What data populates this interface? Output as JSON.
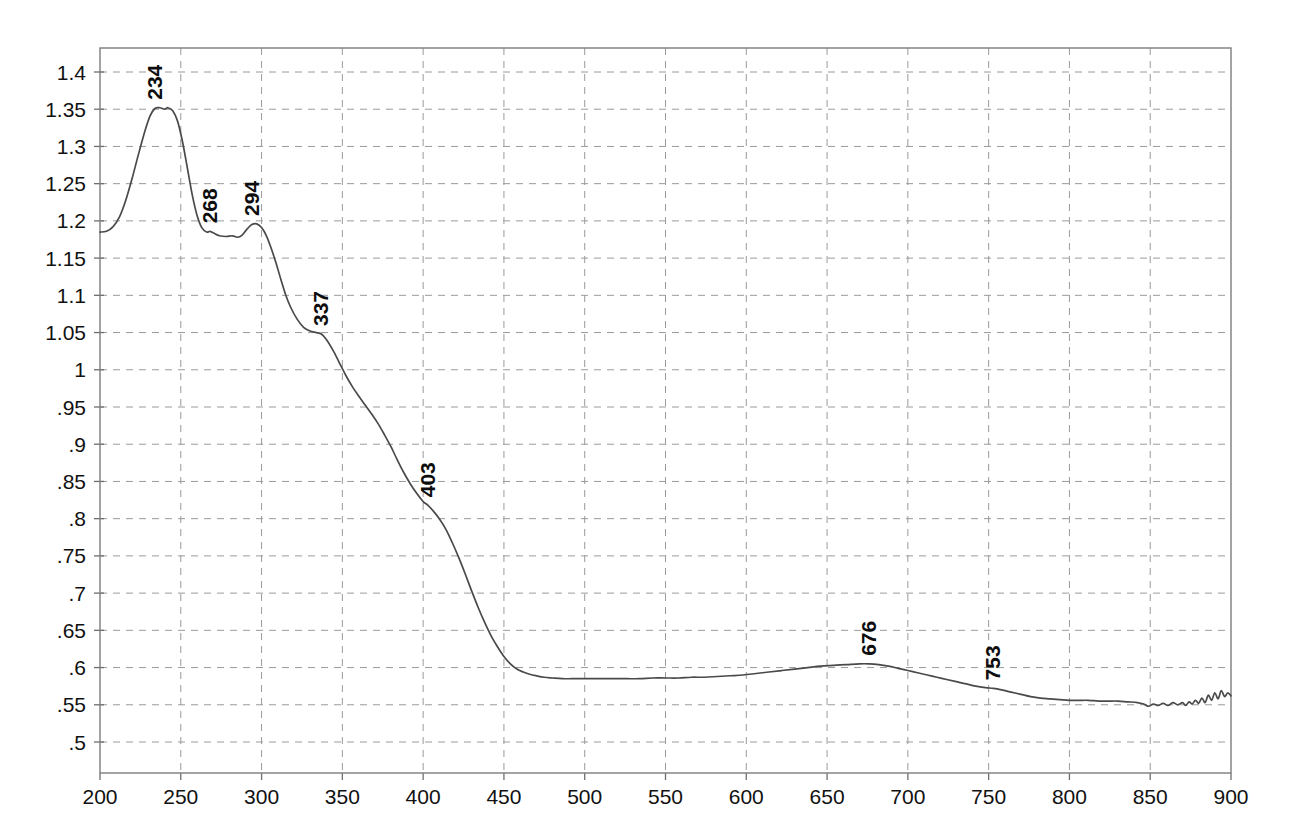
{
  "chart_data": {
    "type": "line",
    "title": "",
    "subtitle": "",
    "xlabel": "",
    "ylabel": "",
    "xlim": [
      200,
      900
    ],
    "ylim": [
      0.475,
      1.425
    ],
    "grid": true,
    "legend": null,
    "x_ticks": [
      200,
      250,
      300,
      350,
      400,
      450,
      500,
      550,
      600,
      650,
      700,
      750,
      800,
      850,
      900
    ],
    "x_tick_labels": [
      "200",
      "250",
      "300",
      "350",
      "400",
      "450",
      "500",
      "550",
      "600",
      "650",
      "700",
      "750",
      "800",
      "850",
      "900"
    ],
    "y_ticks": [
      0.5,
      0.55,
      0.6,
      0.65,
      0.7,
      0.75,
      0.8,
      0.85,
      0.9,
      0.95,
      1.0,
      1.05,
      1.1,
      1.15,
      1.2,
      1.25,
      1.3,
      1.35,
      1.4
    ],
    "y_tick_labels": [
      ".5",
      ".55",
      ".6",
      ".65",
      ".7",
      ".75",
      ".8",
      ".85",
      ".9",
      ".95",
      "1",
      "1.05",
      "1.1",
      "1.15",
      "1.2",
      "1.25",
      "1.3",
      "1.35",
      "1.4"
    ],
    "annotations": [
      {
        "label": "234",
        "x": 234,
        "y": 1.352
      },
      {
        "label": "268",
        "x": 268,
        "y": 1.186
      },
      {
        "label": "294",
        "x": 294,
        "y": 1.196
      },
      {
        "label": "337",
        "x": 337,
        "y": 1.048
      },
      {
        "label": "403",
        "x": 403,
        "y": 0.818
      },
      {
        "label": "676",
        "x": 676,
        "y": 0.605
      },
      {
        "label": "753",
        "x": 753,
        "y": 0.572
      }
    ],
    "series": [
      {
        "name": "absorbance",
        "color": "#4a4a4a",
        "points": [
          [
            200,
            1.185
          ],
          [
            204,
            1.186
          ],
          [
            208,
            1.192
          ],
          [
            212,
            1.205
          ],
          [
            216,
            1.228
          ],
          [
            220,
            1.258
          ],
          [
            224,
            1.291
          ],
          [
            228,
            1.322
          ],
          [
            231,
            1.341
          ],
          [
            234,
            1.351
          ],
          [
            237,
            1.352
          ],
          [
            240,
            1.35
          ],
          [
            242,
            1.352
          ],
          [
            245,
            1.348
          ],
          [
            248,
            1.334
          ],
          [
            251,
            1.307
          ],
          [
            254,
            1.272
          ],
          [
            257,
            1.236
          ],
          [
            260,
            1.208
          ],
          [
            263,
            1.191
          ],
          [
            266,
            1.185
          ],
          [
            268,
            1.186
          ],
          [
            270,
            1.184
          ],
          [
            274,
            1.18
          ],
          [
            278,
            1.179
          ],
          [
            282,
            1.18
          ],
          [
            285,
            1.178
          ],
          [
            288,
            1.181
          ],
          [
            291,
            1.189
          ],
          [
            294,
            1.195
          ],
          [
            297,
            1.196
          ],
          [
            300,
            1.191
          ],
          [
            303,
            1.18
          ],
          [
            306,
            1.163
          ],
          [
            309,
            1.143
          ],
          [
            312,
            1.121
          ],
          [
            315,
            1.1
          ],
          [
            318,
            1.084
          ],
          [
            322,
            1.068
          ],
          [
            326,
            1.057
          ],
          [
            330,
            1.052
          ],
          [
            334,
            1.05
          ],
          [
            337,
            1.048
          ],
          [
            340,
            1.041
          ],
          [
            344,
            1.027
          ],
          [
            348,
            1.01
          ],
          [
            352,
            0.993
          ],
          [
            356,
            0.978
          ],
          [
            360,
            0.965
          ],
          [
            364,
            0.953
          ],
          [
            368,
            0.941
          ],
          [
            372,
            0.928
          ],
          [
            376,
            0.913
          ],
          [
            380,
            0.897
          ],
          [
            384,
            0.879
          ],
          [
            388,
            0.862
          ],
          [
            392,
            0.847
          ],
          [
            396,
            0.834
          ],
          [
            400,
            0.823
          ],
          [
            403,
            0.818
          ],
          [
            406,
            0.811
          ],
          [
            410,
            0.8
          ],
          [
            414,
            0.786
          ],
          [
            418,
            0.768
          ],
          [
            422,
            0.748
          ],
          [
            426,
            0.726
          ],
          [
            430,
            0.703
          ],
          [
            434,
            0.681
          ],
          [
            438,
            0.661
          ],
          [
            442,
            0.643
          ],
          [
            446,
            0.628
          ],
          [
            450,
            0.615
          ],
          [
            454,
            0.605
          ],
          [
            458,
            0.598
          ],
          [
            462,
            0.594
          ],
          [
            466,
            0.591
          ],
          [
            470,
            0.589
          ],
          [
            475,
            0.587
          ],
          [
            480,
            0.586
          ],
          [
            486,
            0.585
          ],
          [
            492,
            0.585
          ],
          [
            498,
            0.585
          ],
          [
            504,
            0.585
          ],
          [
            510,
            0.585
          ],
          [
            518,
            0.585
          ],
          [
            526,
            0.585
          ],
          [
            534,
            0.585
          ],
          [
            542,
            0.586
          ],
          [
            550,
            0.586
          ],
          [
            558,
            0.586
          ],
          [
            566,
            0.587
          ],
          [
            574,
            0.587
          ],
          [
            582,
            0.588
          ],
          [
            590,
            0.589
          ],
          [
            598,
            0.59
          ],
          [
            606,
            0.592
          ],
          [
            614,
            0.594
          ],
          [
            622,
            0.596
          ],
          [
            630,
            0.598
          ],
          [
            638,
            0.6
          ],
          [
            646,
            0.602
          ],
          [
            654,
            0.603
          ],
          [
            662,
            0.604
          ],
          [
            670,
            0.605
          ],
          [
            676,
            0.605
          ],
          [
            682,
            0.604
          ],
          [
            688,
            0.602
          ],
          [
            694,
            0.599
          ],
          [
            700,
            0.596
          ],
          [
            706,
            0.593
          ],
          [
            712,
            0.59
          ],
          [
            718,
            0.587
          ],
          [
            724,
            0.584
          ],
          [
            730,
            0.581
          ],
          [
            736,
            0.578
          ],
          [
            742,
            0.575
          ],
          [
            748,
            0.573
          ],
          [
            753,
            0.572
          ],
          [
            758,
            0.57
          ],
          [
            764,
            0.567
          ],
          [
            770,
            0.564
          ],
          [
            776,
            0.561
          ],
          [
            782,
            0.559
          ],
          [
            788,
            0.558
          ],
          [
            794,
            0.557
          ],
          [
            800,
            0.556
          ],
          [
            806,
            0.556
          ],
          [
            812,
            0.556
          ],
          [
            818,
            0.555
          ],
          [
            824,
            0.555
          ],
          [
            830,
            0.555
          ],
          [
            836,
            0.554
          ],
          [
            842,
            0.553
          ],
          [
            846,
            0.551
          ],
          [
            849,
            0.548
          ],
          [
            852,
            0.551
          ],
          [
            855,
            0.549
          ],
          [
            858,
            0.552
          ],
          [
            861,
            0.549
          ],
          [
            864,
            0.553
          ],
          [
            867,
            0.55
          ],
          [
            870,
            0.553
          ],
          [
            872,
            0.549
          ],
          [
            874,
            0.554
          ],
          [
            876,
            0.551
          ],
          [
            878,
            0.556
          ],
          [
            880,
            0.552
          ],
          [
            882,
            0.559
          ],
          [
            884,
            0.553
          ],
          [
            886,
            0.563
          ],
          [
            888,
            0.556
          ],
          [
            890,
            0.566
          ],
          [
            892,
            0.558
          ],
          [
            894,
            0.569
          ],
          [
            896,
            0.561
          ],
          [
            898,
            0.566
          ],
          [
            900,
            0.562
          ]
        ]
      }
    ]
  }
}
